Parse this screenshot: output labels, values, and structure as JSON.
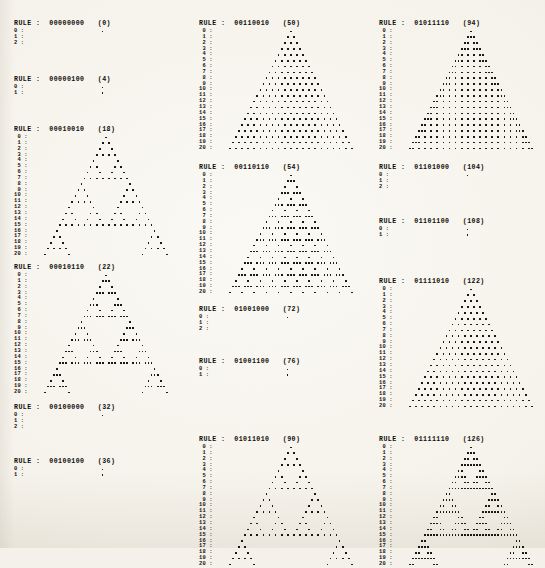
{
  "page": {
    "background_color": "#f4f1ea",
    "ink_color": "#15130d",
    "label_prefix": "RULE :",
    "columns": 3,
    "rows_per_diagram": 21,
    "row_index_start": 0,
    "row_index_end": 20,
    "gutter_separator": ":",
    "cell_width": 51,
    "initial_condition": "single centered cell"
  },
  "columns": [
    {
      "name": "column-left",
      "cells": [
        {
          "id": "rule-0",
          "label": "RULE :  00000000   (0)",
          "binary": "00000000",
          "decimal": 0,
          "visible_rows": 3,
          "top": 14
        },
        {
          "id": "rule-4",
          "label": "RULE :  00000100   (4)",
          "binary": "00000100",
          "decimal": 4,
          "visible_rows": 2,
          "top": 70
        },
        {
          "id": "rule-18",
          "label": "RULE :  00010010   (18)",
          "binary": "00010010",
          "decimal": 18,
          "visible_rows": 21,
          "top": 120
        },
        {
          "id": "rule-22",
          "label": "RULE :  00010110   (22)",
          "binary": "00010110",
          "decimal": 22,
          "visible_rows": 21,
          "top": 258
        },
        {
          "id": "rule-32",
          "label": "RULE :  00100000   (32)",
          "binary": "00100000",
          "decimal": 32,
          "visible_rows": 3,
          "top": 398
        },
        {
          "id": "rule-36",
          "label": "RULE :  00100100   (36)",
          "binary": "00100100",
          "decimal": 36,
          "visible_rows": 2,
          "top": 452
        }
      ]
    },
    {
      "name": "column-middle",
      "cells": [
        {
          "id": "rule-50",
          "label": "RULE :  00110010   (50)",
          "binary": "00110010",
          "decimal": 50,
          "visible_rows": 21,
          "top": 14
        },
        {
          "id": "rule-54",
          "label": "RULE :  00110110   (54)",
          "binary": "00110110",
          "decimal": 54,
          "visible_rows": 21,
          "top": 158
        },
        {
          "id": "rule-72",
          "label": "RULE :  01001000   (72)",
          "binary": "01001000",
          "decimal": 72,
          "visible_rows": 3,
          "top": 300
        },
        {
          "id": "rule-76",
          "label": "RULE :  01001100   (76)",
          "binary": "01001100",
          "decimal": 76,
          "visible_rows": 2,
          "top": 352
        },
        {
          "id": "rule-90",
          "label": "RULE :  01011010   (90)",
          "binary": "01011010",
          "decimal": 90,
          "visible_rows": 21,
          "top": 430
        }
      ]
    },
    {
      "name": "column-right",
      "cells": [
        {
          "id": "rule-94",
          "label": "RULE :  01011110   (94)",
          "binary": "01011110",
          "decimal": 94,
          "visible_rows": 21,
          "top": 14
        },
        {
          "id": "rule-104",
          "label": "RULE :  01101000   (104)",
          "binary": "01101000",
          "decimal": 104,
          "visible_rows": 3,
          "top": 158
        },
        {
          "id": "rule-108",
          "label": "RULE :  01101100   (108)",
          "binary": "01101100",
          "decimal": 108,
          "visible_rows": 2,
          "top": 212
        },
        {
          "id": "rule-122",
          "label": "RULE :  01111010   (122)",
          "binary": "01111010",
          "decimal": 122,
          "visible_rows": 21,
          "top": 272
        },
        {
          "id": "rule-126",
          "label": "RULE :  01111110   (126)",
          "binary": "01111110",
          "decimal": 126,
          "visible_rows": 21,
          "top": 430
        }
      ]
    }
  ]
}
